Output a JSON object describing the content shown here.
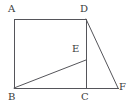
{
  "figure": {
    "type": "geometry-diagram",
    "background_color": "#ffffff",
    "stroke_color": "#55555a",
    "stroke_width": 1,
    "canvas": {
      "width": 132,
      "height": 108
    },
    "points": [
      {
        "id": "A",
        "label": "A",
        "x": 14,
        "y": 19,
        "label_x": 8,
        "label_y": 4
      },
      {
        "id": "D",
        "label": "D",
        "x": 86,
        "y": 19,
        "label_x": 80,
        "label_y": 4
      },
      {
        "id": "E",
        "label": "E",
        "x": 86,
        "y": 60,
        "label_x": 72,
        "label_y": 44
      },
      {
        "id": "B",
        "label": "B",
        "x": 14,
        "y": 88,
        "label_x": 8,
        "label_y": 92
      },
      {
        "id": "C",
        "label": "C",
        "x": 86,
        "y": 88,
        "label_x": 81,
        "label_y": 92
      },
      {
        "id": "F",
        "label": "F",
        "x": 118,
        "y": 88,
        "label_x": 119,
        "label_y": 82
      }
    ],
    "segments": [
      {
        "name": "AD",
        "from": "A",
        "to": "D"
      },
      {
        "name": "AB",
        "from": "A",
        "to": "B"
      },
      {
        "name": "BC",
        "from": "B",
        "to": "C"
      },
      {
        "name": "CF",
        "from": "C",
        "to": "F"
      },
      {
        "name": "DC",
        "from": "D",
        "to": "C"
      },
      {
        "name": "DF",
        "from": "D",
        "to": "F"
      },
      {
        "name": "BE",
        "from": "B",
        "to": "E"
      }
    ]
  }
}
